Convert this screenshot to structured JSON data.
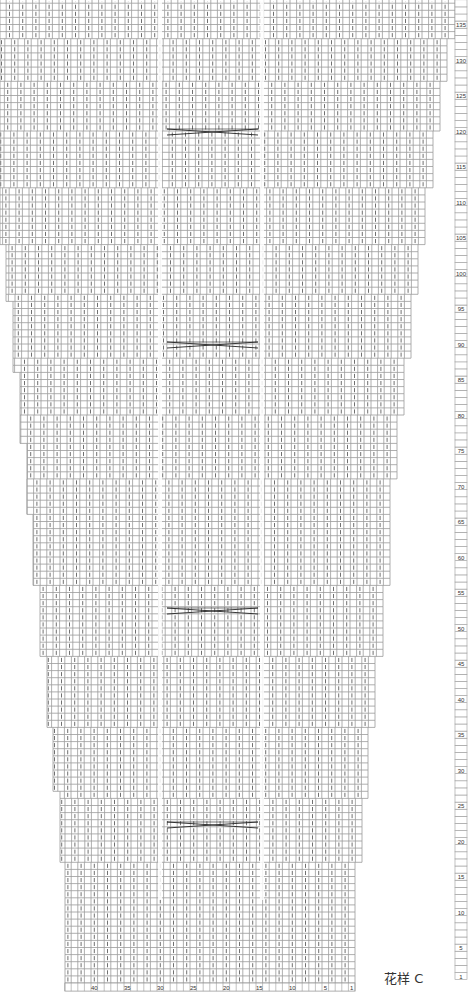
{
  "title": "花样 C",
  "chart_data": {
    "type": "knitting-chart",
    "title": "花样 C",
    "columns": 44,
    "rows_visible_max": 140,
    "row_labels": [
      140,
      135,
      130,
      125,
      120,
      115,
      110,
      105,
      100,
      95,
      90,
      85,
      80,
      75,
      70,
      65,
      60,
      55,
      50,
      45,
      40,
      35,
      30,
      25,
      20,
      15,
      10,
      5,
      1
    ],
    "column_labels": [
      40,
      35,
      30,
      25,
      20,
      15,
      10,
      5,
      1
    ],
    "cable_cross_rows_y": [
      132,
      345,
      611,
      825
    ],
    "cable_span_x": [
      167,
      258
    ],
    "panel_gaps_x": [
      160,
      262
    ],
    "grid": true,
    "shape": "inverted-trapezoid, stepped edges widening upward",
    "colors": {
      "grid": "#9a9a9a",
      "stitch": "#333333",
      "cable": "#222222"
    }
  }
}
